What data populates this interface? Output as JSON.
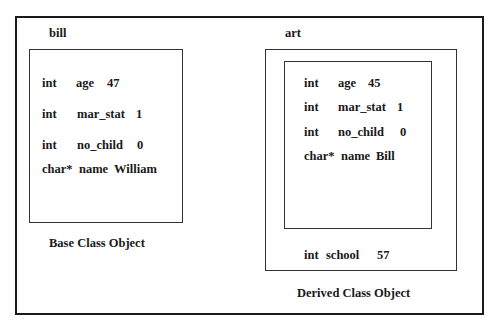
{
  "base_object": {
    "name": "bill",
    "caption": "Base Class Object",
    "fields": [
      {
        "type": "int",
        "name": "age",
        "value": "47"
      },
      {
        "type": "int",
        "name": "mar_stat",
        "value": "1"
      },
      {
        "type": "int",
        "name": "no_child",
        "value": "0"
      },
      {
        "type": "char*",
        "name": "name",
        "value": "William"
      }
    ]
  },
  "derived_object": {
    "name": "art",
    "caption": "Derived Class Object",
    "base_fields": [
      {
        "type": "int",
        "name": "age",
        "value": "45"
      },
      {
        "type": "int",
        "name": "mar_stat",
        "value": "1"
      },
      {
        "type": "int",
        "name": "no_child",
        "value": "0"
      },
      {
        "type": "char*",
        "name": "name",
        "value": "Bill"
      }
    ],
    "own_fields": [
      {
        "type": "int",
        "name": "school",
        "value": "57"
      }
    ]
  }
}
